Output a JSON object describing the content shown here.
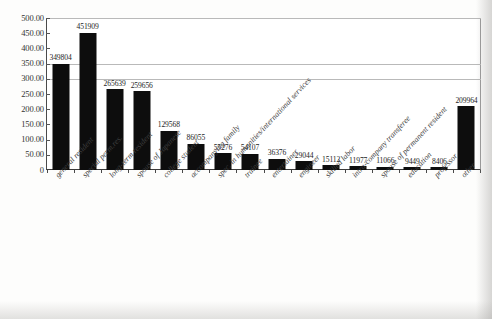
{
  "chart_data": {
    "type": "bar",
    "title": "",
    "xlabel": "",
    "ylabel": "",
    "ylim": [
      0,
      500
    ],
    "grid": true,
    "legend": null,
    "y_tick_labels": [
      "500.00",
      "450.00",
      "400.00",
      "350.00",
      "300.00",
      "250.00",
      "200.00",
      "150.00",
      "100.00",
      "50.00",
      "0"
    ],
    "y_tick_values": [
      500,
      450,
      400,
      350,
      300,
      250,
      200,
      150,
      100,
      50,
      0
    ],
    "y_units_note": "thousands",
    "categories": [
      "general resident",
      "special perm.res.",
      "long-term resident",
      "spouse of Japanese",
      "college student",
      "accompanying family",
      "spec. in humanities/international services",
      "trainee",
      "entertainer",
      "engineer",
      "skilled labor",
      "intra-company transferee",
      "spouse of permanent resident",
      "education",
      "professor",
      "other"
    ],
    "values": [
      349804,
      451909,
      265639,
      259656,
      129568,
      86055,
      55276,
      54107,
      36376,
      29044,
      15112,
      11977,
      11066,
      9449,
      8406,
      209964
    ],
    "value_labels": [
      "349804",
      "451909",
      "265639",
      "259656",
      "129568",
      "86055",
      "55276",
      "54107",
      "36376",
      "29044",
      "15112",
      "11977",
      "11066",
      "9449",
      "8406",
      "209964"
    ]
  },
  "caption": {
    "text": ""
  },
  "colors": {
    "bar": "#0d0d0d",
    "axis": "#3a3a3a",
    "grid": "#b9b9b9",
    "text": "#2a2a2a",
    "background": "#ffffff"
  }
}
